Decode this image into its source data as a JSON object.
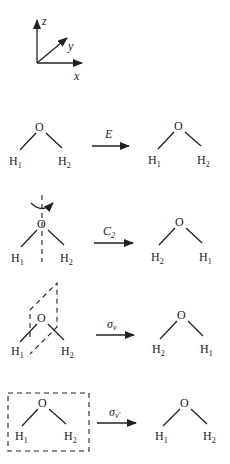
{
  "axes": {
    "x_label": "x",
    "y_label": "y",
    "z_label": "z"
  },
  "molecule": {
    "center_atom": "O",
    "h_atom": "H"
  },
  "operations": [
    {
      "name": "identity",
      "symbol": "E",
      "symbol_sub": "",
      "before": {
        "left": "1",
        "right": "2"
      },
      "after": {
        "left": "1",
        "right": "2"
      }
    },
    {
      "name": "c2-rotation",
      "symbol": "C",
      "symbol_sub": "2",
      "before": {
        "left": "1",
        "right": "2"
      },
      "after": {
        "left": "2",
        "right": "1"
      }
    },
    {
      "name": "sigma-v-reflection",
      "symbol": "σ",
      "symbol_sub": "v",
      "before": {
        "left": "1",
        "right": "2"
      },
      "after": {
        "left": "2",
        "right": "1"
      }
    },
    {
      "name": "sigma-v-prime-reflection",
      "symbol": "σ",
      "symbol_sub": "v'",
      "before": {
        "left": "1",
        "right": "2"
      },
      "after": {
        "left": "1",
        "right": "2"
      }
    }
  ],
  "colors": {
    "ink": "#222222",
    "background": "#ffffff"
  }
}
